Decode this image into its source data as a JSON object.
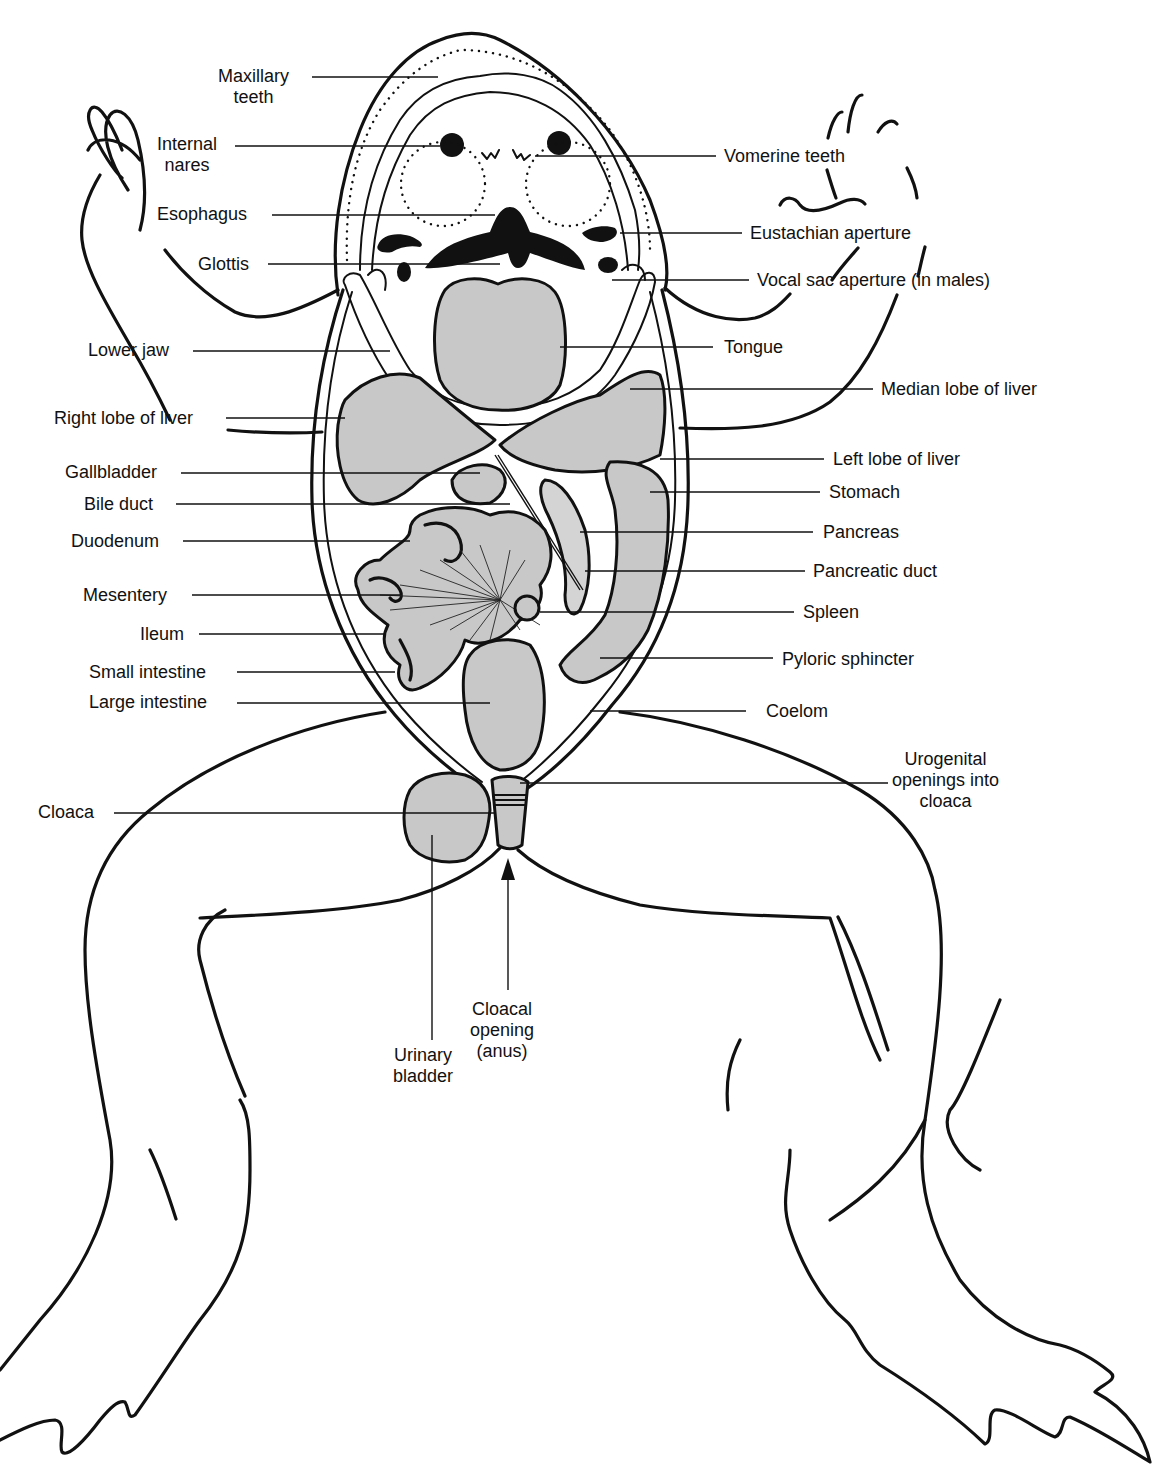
{
  "figure": {
    "colors": {
      "ink": "#111111",
      "organ_fill": "#c8c8c8",
      "background": "#ffffff"
    }
  },
  "labels_left": [
    {
      "id": "maxillary-teeth",
      "text": "Maxillary\nteeth",
      "line1": "Maxillary",
      "line2": "teeth",
      "x": 218,
      "y": 66,
      "lead_y": 77,
      "lead_from": 312,
      "lead_to": 438
    },
    {
      "id": "internal-nares",
      "text": "Internal\nnares",
      "line1": "Internal",
      "line2": "nares",
      "x": 157,
      "y": 134,
      "lead_y": 146,
      "lead_from": 235,
      "lead_to": 440
    },
    {
      "id": "esophagus",
      "text": "Esophagus",
      "x": 157,
      "y": 204,
      "lead_y": 215,
      "lead_from": 272,
      "lead_to": 495
    },
    {
      "id": "glottis",
      "text": "Glottis",
      "x": 198,
      "y": 254,
      "lead_y": 264,
      "lead_from": 268,
      "lead_to": 500
    },
    {
      "id": "lower-jaw",
      "text": "Lower jaw",
      "x": 88,
      "y": 340,
      "lead_y": 351,
      "lead_from": 193,
      "lead_to": 390
    },
    {
      "id": "right-lobe-of-liver",
      "text": "Right lobe of liver",
      "x": 54,
      "y": 408,
      "lead_y": 418,
      "lead_from": 226,
      "lead_to": 345
    },
    {
      "id": "gallbladder",
      "text": "Gallbladder",
      "x": 65,
      "y": 462,
      "lead_y": 473,
      "lead_from": 181,
      "lead_to": 480
    },
    {
      "id": "bile-duct",
      "text": "Bile duct",
      "x": 84,
      "y": 494,
      "lead_y": 504,
      "lead_from": 176,
      "lead_to": 510
    },
    {
      "id": "duodenum",
      "text": "Duodenum",
      "x": 71,
      "y": 531,
      "lead_y": 541,
      "lead_from": 183,
      "lead_to": 410
    },
    {
      "id": "mesentery",
      "text": "Mesentery",
      "x": 83,
      "y": 585,
      "lead_y": 595,
      "lead_from": 192,
      "lead_to": 400
    },
    {
      "id": "ileum",
      "text": "Ileum",
      "x": 140,
      "y": 624,
      "lead_y": 634,
      "lead_from": 199,
      "lead_to": 385
    },
    {
      "id": "small-intestine",
      "text": "Small intestine",
      "x": 89,
      "y": 662,
      "lead_y": 672,
      "lead_from": 237,
      "lead_to": 395
    },
    {
      "id": "large-intestine",
      "text": "Large intestine",
      "x": 89,
      "y": 692,
      "lead_y": 703,
      "lead_from": 237,
      "lead_to": 490
    },
    {
      "id": "cloaca",
      "text": "Cloaca",
      "x": 38,
      "y": 802,
      "lead_y": 813,
      "lead_from": 114,
      "lead_to": 495
    }
  ],
  "labels_right": [
    {
      "id": "vomerine-teeth",
      "text": "Vomerine teeth",
      "x": 724,
      "y": 146,
      "lead_y": 156,
      "lead_from": 535,
      "lead_to": 716
    },
    {
      "id": "eustachian-aperture",
      "text": "Eustachian aperture",
      "x": 750,
      "y": 223,
      "lead_y": 233,
      "lead_from": 620,
      "lead_to": 742
    },
    {
      "id": "vocal-sac-aperture",
      "text": "Vocal sac aperture (in males)",
      "x": 757,
      "y": 270,
      "lead_y": 280,
      "lead_from": 612,
      "lead_to": 749
    },
    {
      "id": "tongue",
      "text": "Tongue",
      "x": 724,
      "y": 337,
      "lead_y": 347,
      "lead_from": 560,
      "lead_to": 713
    },
    {
      "id": "median-lobe-of-liver",
      "text": "Median lobe of liver",
      "x": 881,
      "y": 379,
      "lead_y": 389,
      "lead_from": 630,
      "lead_to": 873
    },
    {
      "id": "left-lobe-of-liver",
      "text": "Left lobe of liver",
      "x": 833,
      "y": 449,
      "lead_y": 459,
      "lead_from": 660,
      "lead_to": 824
    },
    {
      "id": "stomach",
      "text": "Stomach",
      "x": 829,
      "y": 482,
      "lead_y": 492,
      "lead_from": 650,
      "lead_to": 820
    },
    {
      "id": "pancreas",
      "text": "Pancreas",
      "x": 823,
      "y": 522,
      "lead_y": 532,
      "lead_from": 580,
      "lead_to": 813
    },
    {
      "id": "pancreatic-duct",
      "text": "Pancreatic duct",
      "x": 813,
      "y": 561,
      "lead_y": 571,
      "lead_from": 585,
      "lead_to": 805
    },
    {
      "id": "spleen",
      "text": "Spleen",
      "x": 803,
      "y": 602,
      "lead_y": 612,
      "lead_from": 540,
      "lead_to": 794
    },
    {
      "id": "pyloric-sphincter",
      "text": "Pyloric sphincter",
      "x": 782,
      "y": 649,
      "lead_y": 658,
      "lead_from": 600,
      "lead_to": 773
    },
    {
      "id": "coelom",
      "text": "Coelom",
      "x": 766,
      "y": 701,
      "lead_y": 711,
      "lead_from": 590,
      "lead_to": 746
    },
    {
      "id": "urogenital-openings",
      "text": "Urogenital\nopenings into\ncloaca",
      "line1": "Urogenital",
      "line2": "openings into",
      "line3": "cloaca",
      "x": 892,
      "y": 749,
      "lead_y": 783,
      "lead_from": 520,
      "lead_to": 888
    }
  ],
  "labels_bottom": [
    {
      "id": "cloacal-opening",
      "text": "Cloacal\nopening\n(anus)",
      "line1": "Cloacal",
      "line2": "opening",
      "line3": "(anus)",
      "x": 470,
      "y": 999
    },
    {
      "id": "urinary-bladder",
      "text": "Urinary\nbladder",
      "line1": "Urinary",
      "line2": "bladder",
      "x": 393,
      "y": 1045
    }
  ]
}
